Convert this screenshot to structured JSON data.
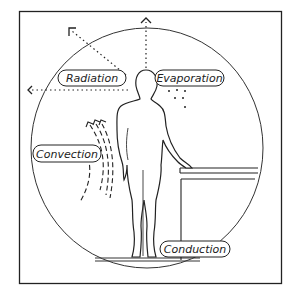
{
  "diagram": {
    "title": "",
    "colors": {
      "ink": "#222222",
      "background": "#ffffff"
    },
    "labels": {
      "radiation": "Radiation",
      "evaporation": "Evaporation",
      "convection": "Convection",
      "conduction": "Conduction"
    },
    "elements": [
      "frame",
      "circle",
      "human-figure",
      "counter-table",
      "floor",
      "radiation-arrows",
      "evaporation-droplets",
      "convection-airflow"
    ]
  }
}
